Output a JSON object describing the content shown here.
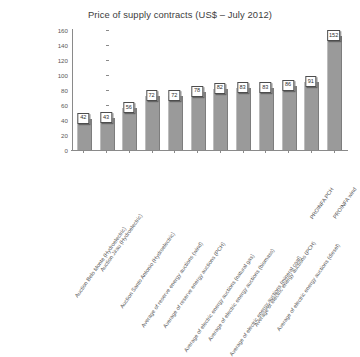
{
  "chart_data": {
    "type": "bar",
    "title": "Price of supply contracts (US$ – July 2012)",
    "xlabel": "",
    "ylabel": "",
    "ylim": [
      0,
      160
    ],
    "ytick_step": 20,
    "yticks": [
      0,
      20,
      40,
      60,
      80,
      100,
      120,
      140,
      160
    ],
    "ytick_labels": [
      "0",
      "20",
      "40",
      "60",
      "80",
      "100",
      "120",
      "140",
      "160"
    ],
    "grid": false,
    "legend": "none",
    "bar_color": "#9a9a9a",
    "label_box_color": "#ffffff",
    "categories": [
      "Auction Belo Monte (Hydroelectric)",
      "Auction Jirau (Hydroelectric)",
      "Auction Santo Antonio (Hydroelectric)",
      "Average of reserve energy auctions (wind)",
      "Average of reserve energy auctions (PCH)",
      "Average of electric energy auctions (natural gas)",
      "Average of electric energy auctions (biomass)",
      "Average of electric energy auctions (mineral coal)",
      "Average of electric energy auctions (PCH)",
      "Average of electric energy auctions (diesel)",
      "PROINFA PCH",
      "PROINFA wind"
    ],
    "values": [
      42,
      43,
      56,
      72,
      72,
      78,
      82,
      83,
      83,
      86,
      91,
      152
    ],
    "value_labels": [
      "42",
      "43",
      "56",
      "72",
      "72",
      "78",
      "82",
      "83",
      "83",
      "86",
      "91",
      "152"
    ]
  }
}
